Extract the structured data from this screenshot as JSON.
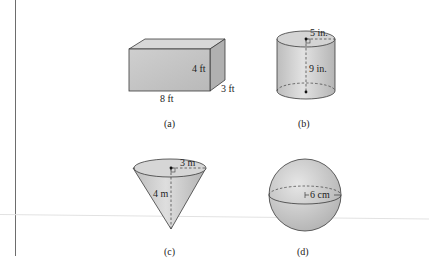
{
  "figure": {
    "panels": [
      {
        "id": "a",
        "caption": "(a)",
        "shape": "rectangular-box",
        "dimensions": {
          "length": "8 ft",
          "height": "4 ft",
          "depth": "3 ft"
        }
      },
      {
        "id": "b",
        "caption": "(b)",
        "shape": "cylinder",
        "dimensions": {
          "radius": "5 in.",
          "height": "9 in."
        }
      },
      {
        "id": "c",
        "caption": "(c)",
        "shape": "cone",
        "dimensions": {
          "radius": "3 m",
          "height": "4 m"
        }
      },
      {
        "id": "d",
        "caption": "(d)",
        "shape": "sphere",
        "dimensions": {
          "radius": "6 cm"
        }
      }
    ],
    "colors": {
      "fill_front": "#c4c4c4",
      "fill_top": "#d6d6d6",
      "fill_side": "#b4b4b4",
      "stroke": "#3a3a3a"
    }
  }
}
